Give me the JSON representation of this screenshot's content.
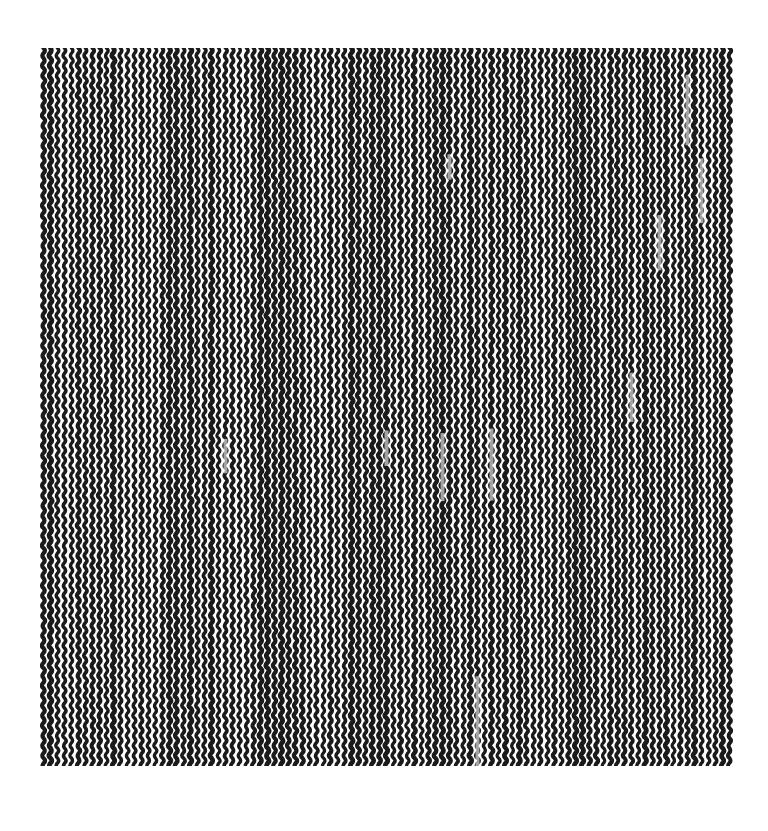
{
  "image": {
    "description": "Abstract black-and-white texture of wavy vertical stitched columns",
    "background": "#ffffff",
    "ink": "#1a1a1a",
    "region": {
      "x": 40,
      "y": 48,
      "width": 694,
      "height": 718
    },
    "pattern": {
      "column_spacing_px": 7,
      "row_period_px": 10,
      "stroke_width_px": 4
    }
  }
}
